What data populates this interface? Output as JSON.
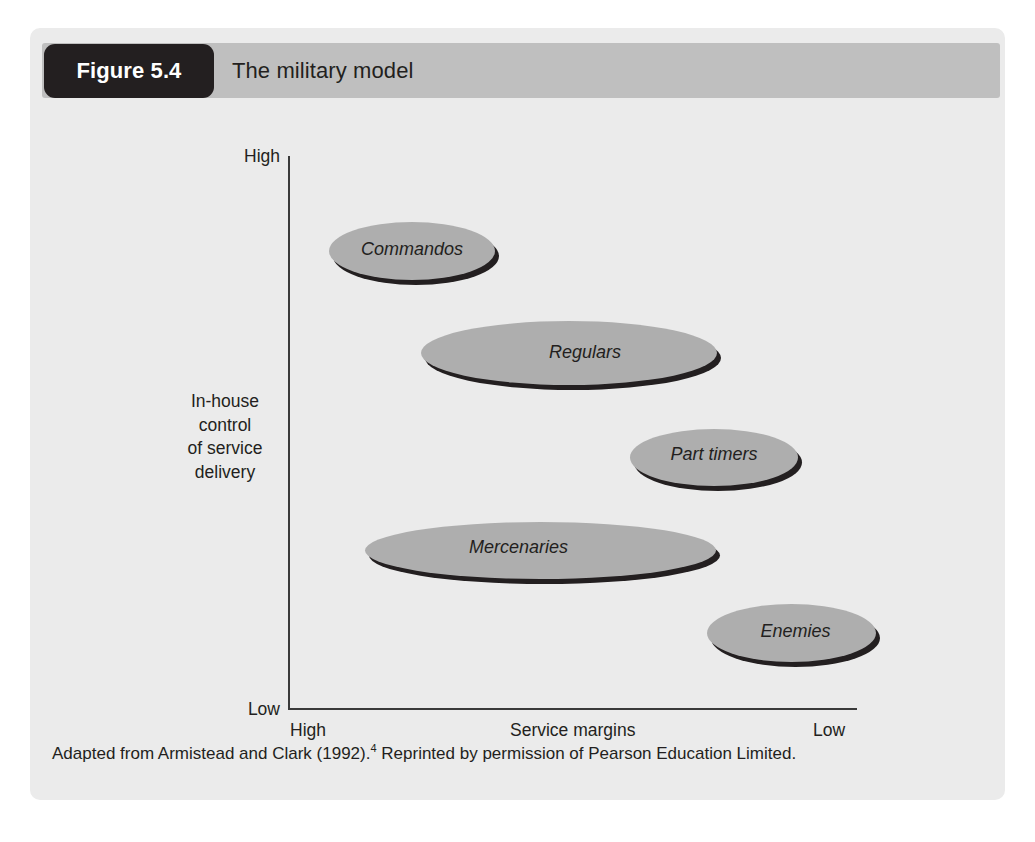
{
  "figure": {
    "number_label": "Figure 5.4",
    "title": "The military model",
    "source_prefix": "Adapted from Armistead and Clark (1992).",
    "source_footnote_marker": "4",
    "source_suffix": " Reprinted by permission of Pearson Education Limited."
  },
  "colors": {
    "panel_background": "#ebebeb",
    "header_bar": "#bfbfbf",
    "number_tab": "#231f20",
    "bubble_fill": "#aeaeae",
    "bubble_shadow": "#231f20",
    "axis_line": "#3a3a3a",
    "text": "#231f20"
  },
  "chart_data": {
    "type": "scatter",
    "title": "The military model",
    "xlabel": "Service margins",
    "ylabel": "In-house control of service delivery",
    "ylabel_lines": [
      "In-house",
      "control",
      "of service",
      "delivery"
    ],
    "x_axis": {
      "label": "Service margins",
      "left_tick": "High",
      "right_tick": "Low",
      "direction": "High to Low (left to right)",
      "ticks": [
        "High",
        "Low"
      ]
    },
    "y_axis": {
      "label": "In-house control of service delivery",
      "top_tick": "High",
      "bottom_tick": "Low",
      "direction": "Low to High (bottom to top)",
      "ticks": [
        "Low",
        "High"
      ]
    },
    "grid": false,
    "legend": false,
    "marker_shape": "ellipse",
    "points": [
      {
        "label": "Commandos",
        "service_margins": "High",
        "in_house_control": "High",
        "x_center_pct": 21.5,
        "y_center_pct": 86.0,
        "width_pct": 29.2,
        "height_pct": 10.5
      },
      {
        "label": "Regulars",
        "service_margins": "Medium-high",
        "in_house_control": "Medium-high",
        "x_center_pct": 47.4,
        "y_center_pct": 68.0,
        "width_pct": 52.0,
        "height_pct": 11.6
      },
      {
        "label": "Part timers",
        "service_margins": "Low",
        "in_house_control": "Medium",
        "x_center_pct": 80.1,
        "y_center_pct": 48.5,
        "width_pct": 29.5,
        "height_pct": 10.3
      },
      {
        "label": "Mercenaries",
        "service_margins": "Medium-high",
        "in_house_control": "Medium-low",
        "x_center_pct": 41.0,
        "y_center_pct": 31.8,
        "width_pct": 61.7,
        "height_pct": 10.3
      },
      {
        "label": "Enemies",
        "service_margins": "Low",
        "in_house_control": "Low",
        "x_center_pct": 93.9,
        "y_center_pct": 17.0,
        "width_pct": 29.7,
        "height_pct": 10.5
      }
    ]
  }
}
